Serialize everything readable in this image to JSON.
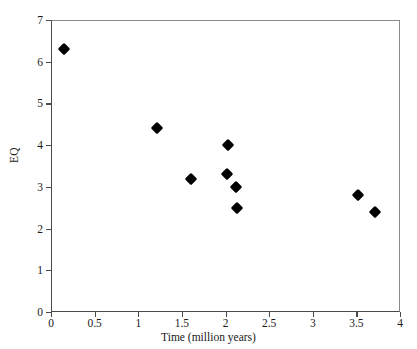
{
  "chart_data": {
    "type": "scatter",
    "title": "",
    "xlabel": "Time (million years)",
    "ylabel": "EQ",
    "xlim": [
      0,
      4
    ],
    "ylim": [
      0,
      7
    ],
    "grid": false,
    "legend": null,
    "xticks": [
      "0",
      "0.5",
      "1",
      "1.5",
      "2",
      "2.5",
      "3",
      "3.5",
      "4"
    ],
    "xtick_values": [
      0,
      0.5,
      1,
      1.5,
      2,
      2.5,
      3,
      3.5,
      4
    ],
    "yticks": [
      "0",
      "1",
      "2",
      "3",
      "4",
      "5",
      "6",
      "7"
    ],
    "ytick_values": [
      0,
      1,
      2,
      3,
      4,
      5,
      6,
      7
    ],
    "marker_style": "filled-diamond",
    "marker_color": "#000000",
    "points": [
      {
        "x": 0.15,
        "y": 6.3
      },
      {
        "x": 1.22,
        "y": 4.4
      },
      {
        "x": 1.61,
        "y": 3.2
      },
      {
        "x": 2.03,
        "y": 4.0
      },
      {
        "x": 2.02,
        "y": 3.3
      },
      {
        "x": 2.12,
        "y": 3.0
      },
      {
        "x": 2.13,
        "y": 2.5
      },
      {
        "x": 3.52,
        "y": 2.8
      },
      {
        "x": 3.71,
        "y": 2.4
      }
    ]
  },
  "axes": {
    "x_title": "Time (million years)",
    "y_title": "EQ"
  },
  "colors": {
    "marker": "#000000",
    "axis": "#4a4a4a",
    "frame": "#8a8a8a",
    "background": "#ffffff"
  }
}
